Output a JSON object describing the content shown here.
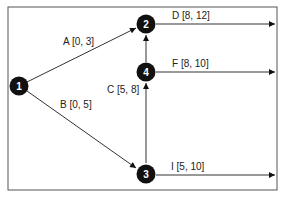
{
  "diagram": {
    "type": "activity-network",
    "colors": {
      "line": "#333333",
      "node_fill": "#111111",
      "node_text": "#ffffff",
      "border": "#555555"
    },
    "nodes": [
      {
        "id": "1",
        "label": "1"
      },
      {
        "id": "2",
        "label": "2"
      },
      {
        "id": "3",
        "label": "3"
      },
      {
        "id": "4",
        "label": "4"
      }
    ],
    "edges": [
      {
        "from": "1",
        "to": "2",
        "label": "A [0, 3]"
      },
      {
        "from": "1",
        "to": "3",
        "label": "B [0, 5]"
      },
      {
        "from": "3",
        "to": "4",
        "label": "C [5, 8]"
      },
      {
        "from": "4",
        "to": "2",
        "label": ""
      },
      {
        "from": "2",
        "to": "out",
        "label": "D [8, 12]"
      },
      {
        "from": "4",
        "to": "out",
        "label": "F [8, 10]"
      },
      {
        "from": "3",
        "to": "out",
        "label": "I [5, 10]"
      }
    ]
  }
}
